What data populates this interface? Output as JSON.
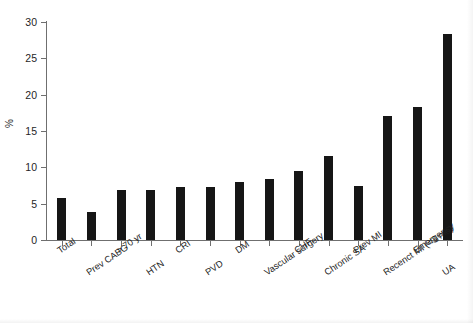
{
  "chart_data": {
    "type": "bar",
    "title": "",
    "subtitle": "",
    "xlabel": "",
    "ylabel": "%",
    "ylim": [
      0,
      30
    ],
    "yticks": [
      0,
      5,
      10,
      15,
      20,
      25,
      30
    ],
    "grid": false,
    "legend": null,
    "bar_color": "#161616",
    "axis_color": "#6f6f6f",
    "categories": [
      "Total",
      "Prev CABG",
      "> 70 yr",
      "HTN",
      "CRI",
      "PVD",
      "DM",
      "Vascular surgery",
      "CHF",
      "Chronic SA",
      "Prev MI",
      "Recenct MI (<3 mo)",
      "Emergency",
      "UA"
    ],
    "values": [
      5.8,
      3.9,
      6.9,
      6.9,
      7.3,
      7.3,
      8.0,
      8.4,
      9.5,
      11.6,
      7.5,
      17.0,
      18.3,
      28.3
    ]
  }
}
